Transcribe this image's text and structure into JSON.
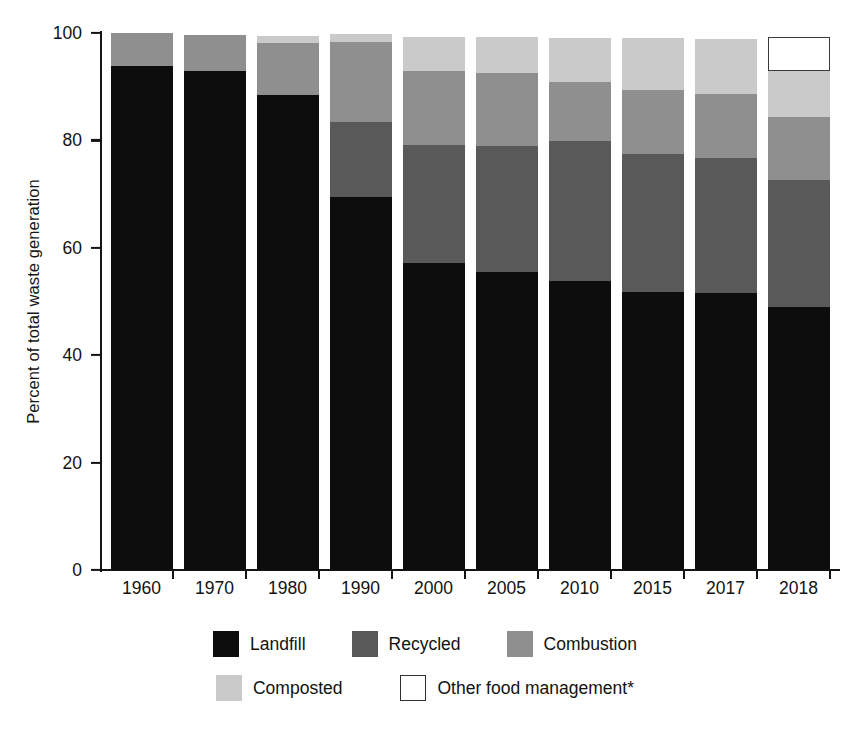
{
  "chart_data": {
    "type": "bar",
    "stacked": true,
    "title": "",
    "subtitle": "",
    "xlabel": "",
    "ylabel": "Percent of total waste generation",
    "ylim": [
      0,
      100
    ],
    "yticks": [
      0,
      20,
      40,
      60,
      80,
      100
    ],
    "ytick_labels": [
      "0",
      "20",
      "40",
      "60",
      "80",
      "100"
    ],
    "grid": false,
    "legend_position": "bottom",
    "categories": [
      "1960",
      "1970",
      "1980",
      "1990",
      "2000",
      "2005",
      "2010",
      "2015",
      "2017",
      "2018"
    ],
    "series": [
      {
        "name": "Landfill",
        "color": "#0d0d0d",
        "values": [
          93.8,
          93.0,
          88.5,
          69.5,
          57.2,
          55.5,
          53.8,
          51.8,
          51.5,
          49.0
        ]
      },
      {
        "name": "Recycled",
        "color": "#595959",
        "values": [
          0.0,
          0.0,
          0.0,
          13.9,
          21.9,
          23.5,
          26.0,
          25.7,
          25.2,
          23.6
        ]
      },
      {
        "name": "Combustion",
        "color": "#8f8f8f",
        "values": [
          6.2,
          6.6,
          9.6,
          15.0,
          13.8,
          13.5,
          11.0,
          11.8,
          12.0,
          11.8
        ]
      },
      {
        "name": "Composted",
        "color": "#cacaca",
        "values": [
          0.0,
          0.0,
          1.4,
          1.4,
          6.3,
          6.8,
          8.3,
          9.7,
          10.2,
          8.6
        ]
      },
      {
        "name": "Other food management*",
        "color": "#ffffff",
        "values": [
          0.0,
          0.0,
          0.0,
          0.0,
          0.0,
          0.0,
          0.0,
          0.0,
          0.0,
          6.3
        ]
      }
    ],
    "stack_tops": {
      "1960": 100.0,
      "1970": 99.6,
      "1980": 99.5,
      "1990": 99.8,
      "2000": 99.2,
      "2005": 99.3,
      "2010": 99.1,
      "2015": 99.0,
      "2017": 98.9,
      "2018": 99.3
    },
    "footnote": "*"
  },
  "legend": {
    "row1": [
      {
        "label": "Landfill",
        "color": "#0d0d0d",
        "kind": "filled"
      },
      {
        "label": "Recycled",
        "color": "#595959",
        "kind": "filled"
      },
      {
        "label": "Combustion",
        "color": "#8f8f8f",
        "kind": "filled"
      }
    ],
    "row2": [
      {
        "label": "Composted",
        "color": "#cacaca",
        "kind": "filled"
      },
      {
        "label": "Other food management*",
        "color": "#ffffff",
        "kind": "outlined"
      }
    ]
  },
  "colors": {
    "axis": "#141414",
    "text": "#121212",
    "background": "#ffffff"
  }
}
